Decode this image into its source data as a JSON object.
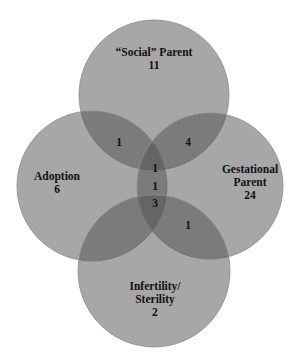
{
  "diagram": {
    "type": "venn",
    "colors": {
      "circle_fill": "#505050",
      "circle_opacity": 0.5,
      "circle_stroke": "#8a8a8a",
      "text": "#111111",
      "background": "#ffffff"
    },
    "sets": [
      {
        "id": "social",
        "line1": "“Social” Parent",
        "line2": "",
        "count": "11"
      },
      {
        "id": "adoption",
        "line1": "Adoption",
        "line2": "",
        "count": "6"
      },
      {
        "id": "gestational",
        "line1": "Gestational",
        "line2": "Parent",
        "count": "24"
      },
      {
        "id": "infertility",
        "line1": "Infertility/",
        "line2": "Sterility",
        "count": "2"
      }
    ],
    "intersections": [
      {
        "sets": "social+adoption",
        "count": "1"
      },
      {
        "sets": "social+gestational",
        "count": "4"
      },
      {
        "sets": "center-top",
        "count": "1"
      },
      {
        "sets": "center-middle",
        "count": "1"
      },
      {
        "sets": "center-bottom",
        "count": "3"
      },
      {
        "sets": "gestational+infertility",
        "count": "1"
      }
    ]
  }
}
